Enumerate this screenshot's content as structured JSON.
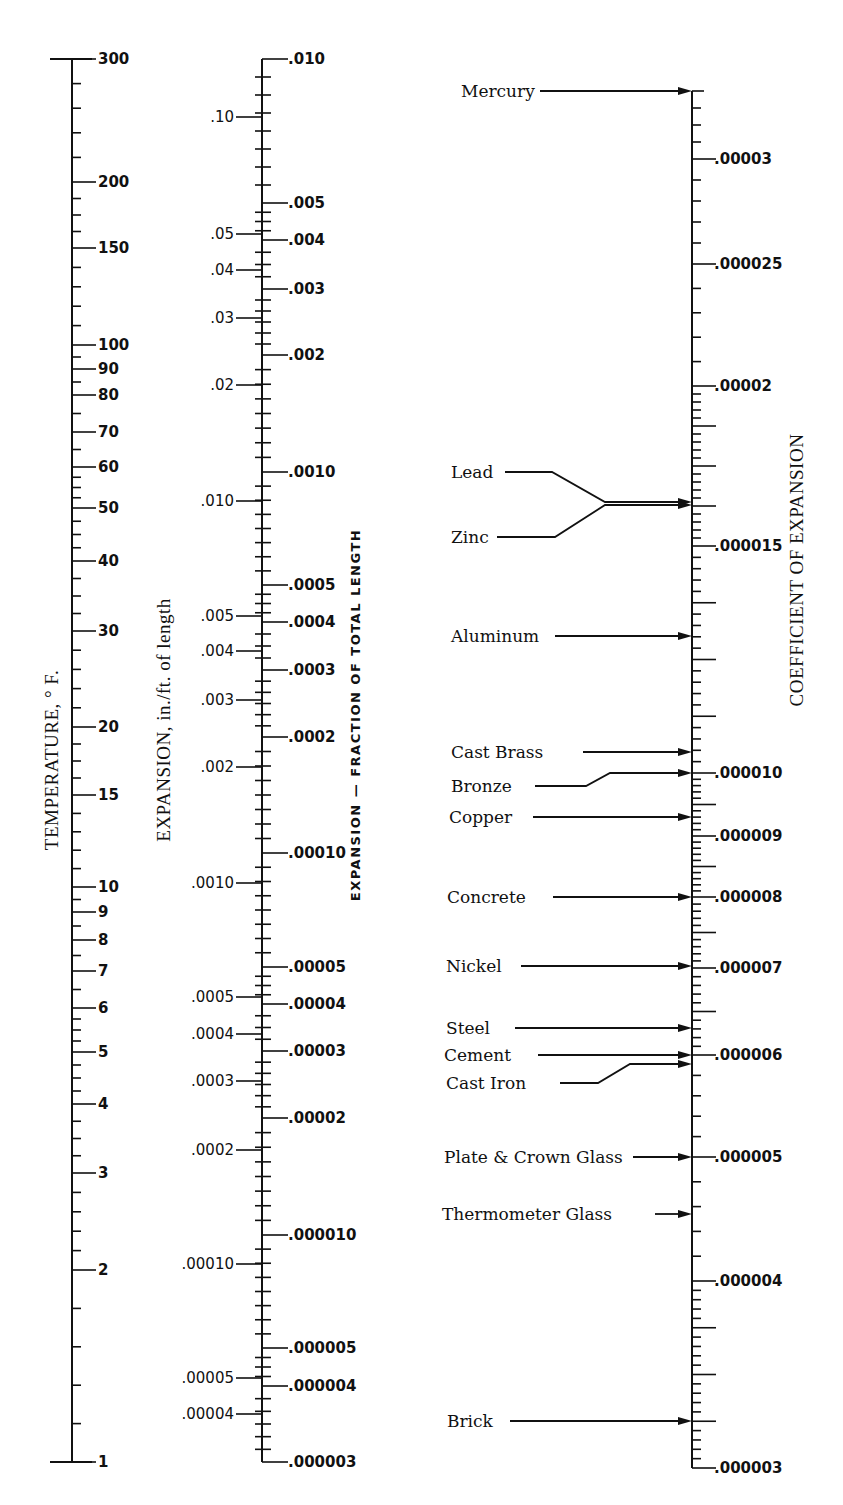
{
  "chart_data": {
    "type": "nomograph",
    "title": "",
    "axes": [
      {
        "id": "temperature",
        "label": "TEMPERATURE, ° F.",
        "scale": "log",
        "range": [
          1,
          300
        ],
        "ticks": [
          {
            "label": "300",
            "value": 300,
            "y": 59
          },
          {
            "label": "200",
            "value": 200,
            "y": 182
          },
          {
            "label": "150",
            "value": 150,
            "y": 248
          },
          {
            "label": "100",
            "value": 100,
            "y": 345
          },
          {
            "label": "90",
            "value": 90,
            "y": 369
          },
          {
            "label": "80",
            "value": 80,
            "y": 395
          },
          {
            "label": "70",
            "value": 70,
            "y": 432
          },
          {
            "label": "60",
            "value": 60,
            "y": 467
          },
          {
            "label": "50",
            "value": 50,
            "y": 508
          },
          {
            "label": "40",
            "value": 40,
            "y": 561
          },
          {
            "label": "30",
            "value": 30,
            "y": 631
          },
          {
            "label": "20",
            "value": 20,
            "y": 727
          },
          {
            "label": "15",
            "value": 15,
            "y": 795
          },
          {
            "label": "10",
            "value": 10,
            "y": 887
          },
          {
            "label": "9",
            "value": 9,
            "y": 912
          },
          {
            "label": "8",
            "value": 8,
            "y": 940
          },
          {
            "label": "7",
            "value": 7,
            "y": 971
          },
          {
            "label": "6",
            "value": 6,
            "y": 1008
          },
          {
            "label": "5",
            "value": 5,
            "y": 1052
          },
          {
            "label": "4",
            "value": 4,
            "y": 1104
          },
          {
            "label": "3",
            "value": 3,
            "y": 1173
          },
          {
            "label": "2",
            "value": 2,
            "y": 1270
          },
          {
            "label": "1",
            "value": 1,
            "y": 1462
          }
        ]
      },
      {
        "id": "expansion_in_per_ft",
        "label": "EXPANSION, in./ft. of length",
        "scale": "log",
        "range": [
          4e-05,
          0.1
        ],
        "side": "left",
        "ticks": [
          {
            "label": ".10",
            "value": 0.1,
            "y": 117
          },
          {
            "label": ".05",
            "value": 0.05,
            "y": 234
          },
          {
            "label": ".04",
            "value": 0.04,
            "y": 270
          },
          {
            "label": ".03",
            "value": 0.03,
            "y": 318
          },
          {
            "label": ".02",
            "value": 0.02,
            "y": 385
          },
          {
            "label": ".010",
            "value": 0.01,
            "y": 501
          },
          {
            "label": ".005",
            "value": 0.005,
            "y": 616
          },
          {
            "label": ".004",
            "value": 0.004,
            "y": 651
          },
          {
            "label": ".003",
            "value": 0.003,
            "y": 700
          },
          {
            "label": ".002",
            "value": 0.002,
            "y": 767
          },
          {
            "label": ".0010",
            "value": 0.001,
            "y": 883
          },
          {
            "label": ".0005",
            "value": 0.0005,
            "y": 997
          },
          {
            "label": ".0004",
            "value": 0.0004,
            "y": 1034
          },
          {
            "label": ".0003",
            "value": 0.0003,
            "y": 1081
          },
          {
            "label": ".0002",
            "value": 0.0002,
            "y": 1150
          },
          {
            "label": ".00010",
            "value": 0.0001,
            "y": 1264
          },
          {
            "label": ".00005",
            "value": 5e-05,
            "y": 1378
          },
          {
            "label": ".00004",
            "value": 4e-05,
            "y": 1414
          }
        ]
      },
      {
        "id": "expansion_fraction",
        "label": "EXPANSION — FRACTION OF TOTAL LENGTH",
        "scale": "log",
        "range": [
          3e-06,
          0.01
        ],
        "side": "right",
        "ticks": [
          {
            "label": ".010",
            "value": 0.01,
            "y": 59
          },
          {
            "label": ".005",
            "value": 0.005,
            "y": 203
          },
          {
            "label": ".004",
            "value": 0.004,
            "y": 240
          },
          {
            "label": ".003",
            "value": 0.003,
            "y": 289
          },
          {
            "label": ".002",
            "value": 0.002,
            "y": 355
          },
          {
            "label": ".0010",
            "value": 0.001,
            "y": 472
          },
          {
            "label": ".0005",
            "value": 0.0005,
            "y": 585
          },
          {
            "label": ".0004",
            "value": 0.0004,
            "y": 622
          },
          {
            "label": ".0003",
            "value": 0.0003,
            "y": 670
          },
          {
            "label": ".0002",
            "value": 0.0002,
            "y": 737
          },
          {
            "label": ".00010",
            "value": 0.0001,
            "y": 853
          },
          {
            "label": ".00005",
            "value": 5e-05,
            "y": 967
          },
          {
            "label": ".00004",
            "value": 4e-05,
            "y": 1004
          },
          {
            "label": ".00003",
            "value": 3e-05,
            "y": 1051
          },
          {
            "label": ".00002",
            "value": 2e-05,
            "y": 1118
          },
          {
            "label": ".000010",
            "value": 1e-05,
            "y": 1235
          },
          {
            "label": ".000005",
            "value": 5e-06,
            "y": 1348
          },
          {
            "label": ".000004",
            "value": 4e-06,
            "y": 1386
          },
          {
            "label": ".000003",
            "value": 3e-06,
            "y": 1462
          }
        ]
      },
      {
        "id": "coefficient",
        "label": "COEFFICIENT OF EXPANSION",
        "scale": "log",
        "range": [
          3e-06,
          3.4e-05
        ],
        "ticks": [
          {
            "label": ".00003",
            "value": 3e-05,
            "y": 159
          },
          {
            "label": ".000025",
            "value": 2.5e-05,
            "y": 264
          },
          {
            "label": ".00002",
            "value": 2e-05,
            "y": 386
          },
          {
            "label": ".000015",
            "value": 1.5e-05,
            "y": 546
          },
          {
            "label": ".000010",
            "value": 1e-05,
            "y": 773
          },
          {
            "label": ".000009",
            "value": 9e-06,
            "y": 836
          },
          {
            "label": ".000008",
            "value": 8e-06,
            "y": 897
          },
          {
            "label": ".000007",
            "value": 7e-06,
            "y": 968
          },
          {
            "label": ".000006",
            "value": 6e-06,
            "y": 1055
          },
          {
            "label": ".000005",
            "value": 5e-06,
            "y": 1157
          },
          {
            "label": ".000004",
            "value": 4e-06,
            "y": 1281
          },
          {
            "label": ".000003",
            "value": 3e-06,
            "y": 1468
          }
        ]
      }
    ],
    "materials": [
      {
        "name": "Mercury",
        "label_y": 91,
        "arrow_y": 91,
        "approx_coefficient": 3.37e-05
      },
      {
        "name": "Lead",
        "label_y": 472,
        "arrow_y": 502,
        "approx_coefficient": 1.63e-05
      },
      {
        "name": "Zinc",
        "label_y": 537,
        "arrow_y": 505,
        "approx_coefficient": 1.62e-05
      },
      {
        "name": "Aluminum",
        "label_y": 636,
        "arrow_y": 636,
        "approx_coefficient": 1.28e-05
      },
      {
        "name": "Cast Brass",
        "label_y": 752,
        "arrow_y": 752,
        "approx_coefficient": 1.04e-05
      },
      {
        "name": "Bronze",
        "label_y": 786,
        "arrow_y": 773,
        "approx_coefficient": 1e-05
      },
      {
        "name": "Copper",
        "label_y": 817,
        "arrow_y": 817,
        "approx_coefficient": 9.3e-06
      },
      {
        "name": "Concrete",
        "label_y": 897,
        "arrow_y": 897,
        "approx_coefficient": 8e-06
      },
      {
        "name": "Nickel",
        "label_y": 966,
        "arrow_y": 966,
        "approx_coefficient": 7e-06
      },
      {
        "name": "Steel",
        "label_y": 1028,
        "arrow_y": 1028,
        "approx_coefficient": 6.5e-06
      },
      {
        "name": "Cement",
        "label_y": 1055,
        "arrow_y": 1055,
        "approx_coefficient": 6e-06
      },
      {
        "name": "Cast Iron",
        "label_y": 1083,
        "arrow_y": 1064,
        "approx_coefficient": 5.9e-06
      },
      {
        "name": "Plate & Crown Glass",
        "label_y": 1157,
        "arrow_y": 1157,
        "approx_coefficient": 5e-06
      },
      {
        "name": "Thermometer Glass",
        "label_y": 1214,
        "arrow_y": 1214,
        "approx_coefficient": 4.5e-06
      },
      {
        "name": "Brick",
        "label_y": 1421,
        "arrow_y": 1421,
        "approx_coefficient": 3.1e-06
      }
    ],
    "grid": false,
    "legend": null
  }
}
